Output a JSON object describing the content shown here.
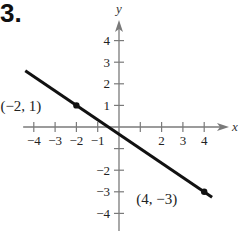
{
  "problem": {
    "number": "3."
  },
  "chart_data": {
    "type": "line",
    "title": "",
    "xlabel": "x",
    "ylabel": "y",
    "xlim": [
      -4.5,
      4.8
    ],
    "ylim": [
      -4.6,
      4.8
    ],
    "x_ticks": [
      -4,
      -3,
      -2,
      -1,
      1,
      2,
      3,
      4
    ],
    "x_tick_labels": [
      "−4",
      "−3",
      "−2",
      "−1",
      "2",
      "3",
      "4"
    ],
    "y_ticks": [
      -4,
      -3,
      -2,
      -1,
      1,
      2,
      3,
      4
    ],
    "y_tick_labels": [
      "4",
      "3",
      "2",
      "1",
      "−2",
      "−3",
      "−4"
    ],
    "grid": false,
    "series": [
      {
        "name": "line",
        "equation": "y = -2/3 x - 1/3",
        "x": [
          -4.4,
          4.37
        ],
        "y": [
          2.6,
          -3.25
        ],
        "color": "#111111"
      }
    ],
    "points": [
      {
        "x": -2,
        "y": 1,
        "label": "(−2, 1)"
      },
      {
        "x": 4,
        "y": -3,
        "label": "(4, −3)"
      }
    ]
  }
}
